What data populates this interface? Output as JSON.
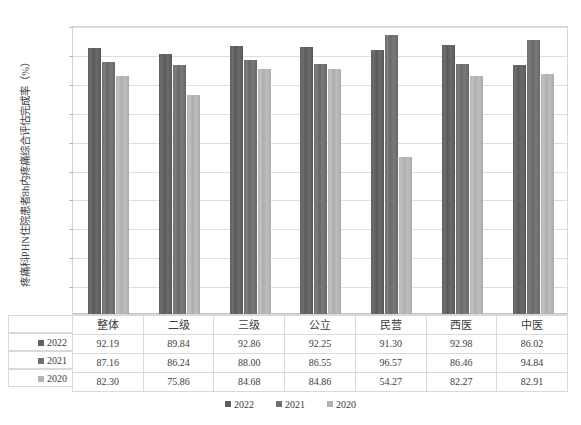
{
  "chart_data": {
    "type": "bar",
    "title": "",
    "subtitle": "",
    "xlabel": "",
    "ylabel": "疼痛科PHN住院患者8h内疼痛综合评估完成率（%）",
    "ylim": [
      0,
      100
    ],
    "ytick_step": 10,
    "ytick_labels": [
      "0.00",
      "10.00",
      "20.00",
      "30.00",
      "40.00",
      "50.00",
      "60.00",
      "70.00",
      "80.00",
      "90.00",
      "100.00"
    ],
    "grid": true,
    "legend_position": "bottom",
    "categories": [
      "整体",
      "二级",
      "三级",
      "公立",
      "民营",
      "西医",
      "中医"
    ],
    "series": [
      {
        "name": "2022",
        "color": "#5f5f5f",
        "values": [
          92.19,
          89.84,
          92.86,
          92.25,
          91.3,
          92.98,
          86.02
        ]
      },
      {
        "name": "2021",
        "color": "#6f6f6f",
        "values": [
          87.16,
          86.24,
          88.0,
          86.55,
          96.57,
          86.46,
          94.84
        ]
      },
      {
        "name": "2020",
        "color": "#b4b4b4",
        "values": [
          82.3,
          75.86,
          84.68,
          84.86,
          54.27,
          82.27,
          82.91
        ]
      }
    ]
  },
  "data_table": {
    "corner_label": "",
    "column_headers": [
      "整体",
      "二级",
      "三级",
      "公立",
      "民营",
      "西医",
      "中医"
    ],
    "rows": [
      {
        "label": "2022",
        "swatch_class": "sw-2022",
        "values": [
          "92.19",
          "89.84",
          "92.86",
          "92.25",
          "91.30",
          "92.98",
          "86.02"
        ]
      },
      {
        "label": "2021",
        "swatch_class": "sw-2021",
        "values": [
          "87.16",
          "86.24",
          "88.00",
          "86.55",
          "96.57",
          "86.46",
          "94.84"
        ]
      },
      {
        "label": "2020",
        "swatch_class": "sw-2020",
        "values": [
          "82.30",
          "75.86",
          "84.68",
          "84.86",
          "54.27",
          "82.27",
          "82.91"
        ]
      }
    ]
  },
  "legend": {
    "items": [
      {
        "label": "2022",
        "color": "#5f5f5f"
      },
      {
        "label": "2021",
        "color": "#6f6f6f"
      },
      {
        "label": "2020",
        "color": "#b4b4b4"
      }
    ]
  }
}
